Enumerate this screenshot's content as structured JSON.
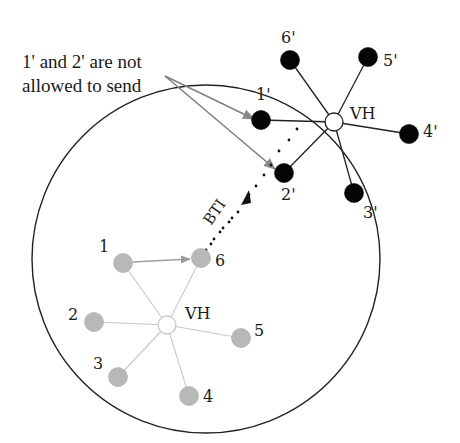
{
  "annotation": {
    "line1": "1' and 2' are not",
    "line2": "allowed to send"
  },
  "coverage_area": {
    "cx": 206,
    "cy": 259,
    "r": 174
  },
  "cluster_inside": {
    "hub_label": "VH",
    "hub": {
      "x": 167,
      "y": 325
    },
    "color": "#b3b3b3",
    "nodes": [
      {
        "id": "1",
        "x": 123,
        "y": 263,
        "lx": 99,
        "ly": 252
      },
      {
        "id": "6",
        "x": 201,
        "y": 258,
        "lx": 215,
        "ly": 266
      },
      {
        "id": "2",
        "x": 94,
        "y": 322,
        "lx": 68,
        "ly": 320
      },
      {
        "id": "5",
        "x": 241,
        "y": 338,
        "lx": 254,
        "ly": 336
      },
      {
        "id": "3",
        "x": 118,
        "y": 377,
        "lx": 93,
        "ly": 369
      },
      {
        "id": "4",
        "x": 189,
        "y": 396,
        "lx": 203,
        "ly": 402
      }
    ],
    "hub_label_pos": {
      "x": 185,
      "y": 319
    }
  },
  "cluster_outside": {
    "hub_label": "VH",
    "hub": {
      "x": 334,
      "y": 122
    },
    "color": "#000000",
    "nodes": [
      {
        "id": "6'",
        "x": 290,
        "y": 60,
        "lx": 281,
        "ly": 43
      },
      {
        "id": "5'",
        "x": 368,
        "y": 57,
        "lx": 383,
        "ly": 66
      },
      {
        "id": "1'",
        "x": 261,
        "y": 120,
        "lx": 256,
        "ly": 100
      },
      {
        "id": "4'",
        "x": 409,
        "y": 134,
        "lx": 423,
        "ly": 137
      },
      {
        "id": "2'",
        "x": 284,
        "y": 173,
        "lx": 281,
        "ly": 200
      },
      {
        "id": "3'",
        "x": 354,
        "y": 193,
        "lx": 363,
        "ly": 218
      }
    ],
    "hub_label_pos": {
      "x": 350,
      "y": 119
    }
  },
  "bti_label": "BTI",
  "edges": {
    "gray_arrow": {
      "from": "1",
      "to": "6"
    }
  }
}
